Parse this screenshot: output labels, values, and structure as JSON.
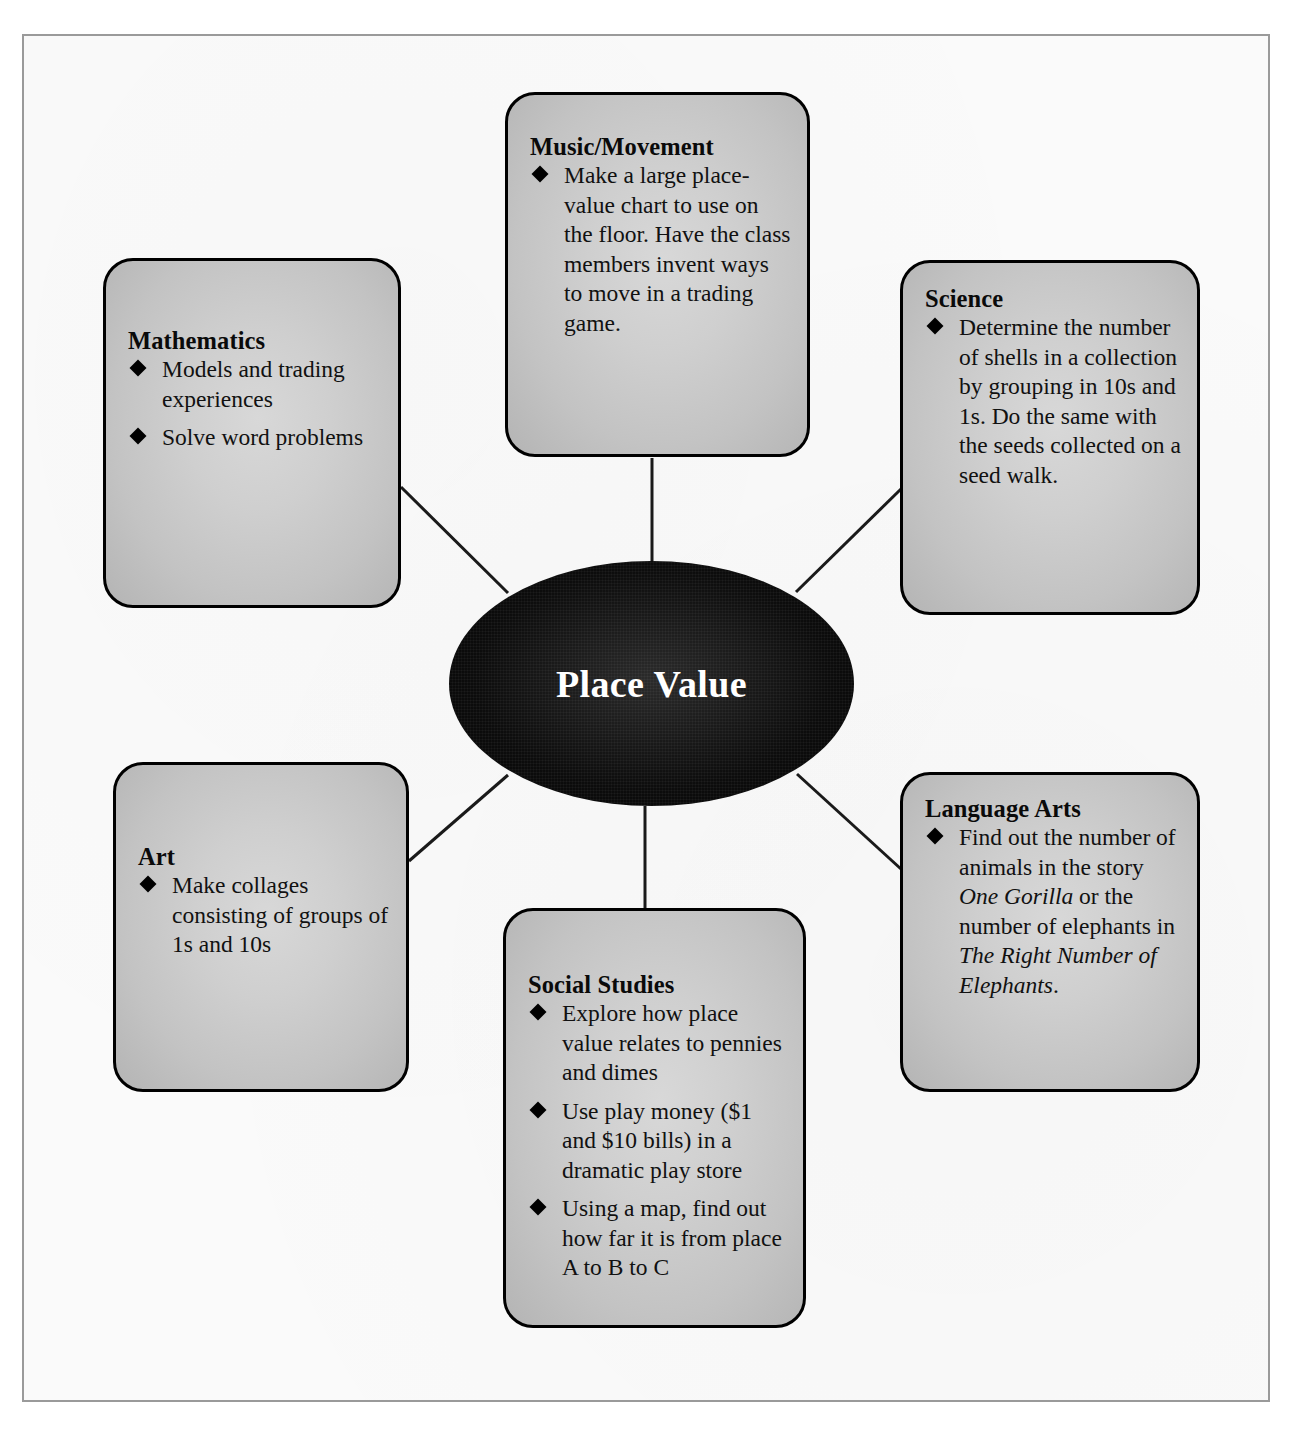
{
  "diagram": {
    "type": "concept-web",
    "center": {
      "label": "Place Value"
    },
    "nodes": [
      {
        "id": "mathematics",
        "title": "Mathematics",
        "bullets": [
          [
            {
              "t": "Models and trading experiences",
              "style": "normal"
            }
          ],
          [
            {
              "t": "Solve word problems",
              "style": "normal"
            }
          ]
        ]
      },
      {
        "id": "music-movement",
        "title": "Music/Movement",
        "bullets": [
          [
            {
              "t": "Make a large place-value chart to use on the floor. Have the class members invent ways to move in a trading game.",
              "style": "normal"
            }
          ]
        ]
      },
      {
        "id": "science",
        "title": "Science",
        "bullets": [
          [
            {
              "t": "Determine the number of shells in a collection by grouping in 10s and 1s. Do the same with the seeds collected on a seed walk.",
              "style": "normal"
            }
          ]
        ]
      },
      {
        "id": "art",
        "title": "Art",
        "bullets": [
          [
            {
              "t": "Make collages consisting of groups of 1s and 10s",
              "style": "normal"
            }
          ]
        ]
      },
      {
        "id": "social-studies",
        "title": "Social Studies",
        "bullets": [
          [
            {
              "t": "Explore how place value relates to pennies and dimes",
              "style": "normal"
            }
          ],
          [
            {
              "t": "Use play money ($1 and $10 bills) in a dramatic play store",
              "style": "normal"
            }
          ],
          [
            {
              "t": "Using a map, find out how far it is from place A to B to C",
              "style": "normal"
            }
          ]
        ]
      },
      {
        "id": "language-arts",
        "title": "Language Arts",
        "bullets": [
          [
            {
              "t": "Find out the number of animals in the story ",
              "style": "normal"
            },
            {
              "t": "One Gorilla",
              "style": "italic"
            },
            {
              "t": " or the number of elephants in ",
              "style": "normal"
            },
            {
              "t": "The Right Number of Elephants",
              "style": "italic"
            },
            {
              "t": ".",
              "style": "normal"
            }
          ]
        ]
      }
    ],
    "connectors": [
      {
        "from": "center",
        "to": "mathematics"
      },
      {
        "from": "center",
        "to": "music-movement"
      },
      {
        "from": "center",
        "to": "science"
      },
      {
        "from": "center",
        "to": "art"
      },
      {
        "from": "center",
        "to": "social-studies"
      },
      {
        "from": "center",
        "to": "language-arts"
      }
    ],
    "colors": {
      "center_fill": "#0c0c0c",
      "center_text": "#ffffff",
      "box_fill": "#cccccc",
      "box_border": "#000000",
      "bullet": "#000000",
      "text": "#111111",
      "frame_border": "#9a9a9a",
      "page_bg": "#fafafa"
    },
    "bullet_glyph": "filled-diamond"
  }
}
